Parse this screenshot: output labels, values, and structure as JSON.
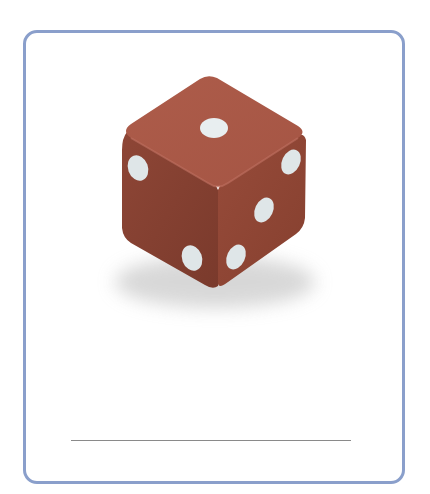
{
  "card": {
    "border_color": "#8a9fcb",
    "background": "#ffffff"
  },
  "image": {
    "subject": "die",
    "die_color": "#a35645",
    "pip_color": "#e6ecee",
    "faces_visible": {
      "top": 1,
      "left": 2,
      "right": 3
    }
  },
  "answer": {
    "text": "",
    "line_color": "#8a8a8a"
  }
}
